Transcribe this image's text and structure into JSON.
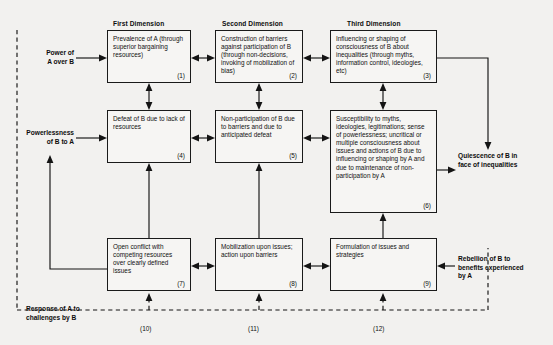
{
  "diagram": {
    "column_headers": [
      {
        "id": "first",
        "label": "First Dimension"
      },
      {
        "id": "second",
        "label": "Second Dimension"
      },
      {
        "id": "third",
        "label": "Third Dimension"
      }
    ],
    "boxes": [
      {
        "id": "box-1",
        "number": "(1)",
        "text": "Prevalence of A (through superior bargaining resources)"
      },
      {
        "id": "box-2",
        "number": "(2)",
        "text": "Construction of barriers against participation of B (through non-decisions, invoking of mobilization of bias)"
      },
      {
        "id": "box-3",
        "number": "(3)",
        "text": "Influencing or shaping of consciousness of B about inequalities (through myths, information control, ideologies, etc)"
      },
      {
        "id": "box-4",
        "number": "(4)",
        "text": "Defeat of B due to lack of resources"
      },
      {
        "id": "box-5",
        "number": "(5)",
        "text": "Non-participation of B due to barriers and due to anticipated defeat"
      },
      {
        "id": "box-6",
        "number": "(6)",
        "text": "Susceptibility to myths, ideologies, legitimations; sense of powerlessness; uncritical or multiple consciousness about issues and actions of B due to influencing or shaping by A and due to maintenance of non-participation by A"
      },
      {
        "id": "box-7",
        "number": "(7)",
        "text": "Open conflict with competing resources over clearly defined issues"
      },
      {
        "id": "box-8",
        "number": "(8)",
        "text": "Mobilization upon issues; action upon barriers"
      },
      {
        "id": "box-9",
        "number": "(9)",
        "text": "Formulation of issues and strategies"
      }
    ],
    "side_labels": [
      {
        "id": "power-of-a",
        "text_line1": "Power of",
        "text_line2": "A over B"
      },
      {
        "id": "powerlessness",
        "text_line1": "Powerlessness",
        "text_line2": "of B to A"
      },
      {
        "id": "response-of-a",
        "text_line1": "Response of A to",
        "text_line2": "challenges by B"
      },
      {
        "id": "quiescence",
        "text_line1": "Quiescence of B in",
        "text_line2": "face of inequalities"
      },
      {
        "id": "rebellion",
        "text_line1": "Rebellion of B to",
        "text_line2": "benefits experienced",
        "text_line3": "by A"
      }
    ],
    "feedback_numbers": [
      {
        "id": "fb-10",
        "label": "(10)"
      },
      {
        "id": "fb-11",
        "label": "(11)"
      },
      {
        "id": "fb-12",
        "label": "(12)"
      }
    ],
    "colors": {
      "background": "#f2f1ef",
      "line": "#141414",
      "box_fill": "#f6f5f3",
      "text": "#111111"
    }
  }
}
